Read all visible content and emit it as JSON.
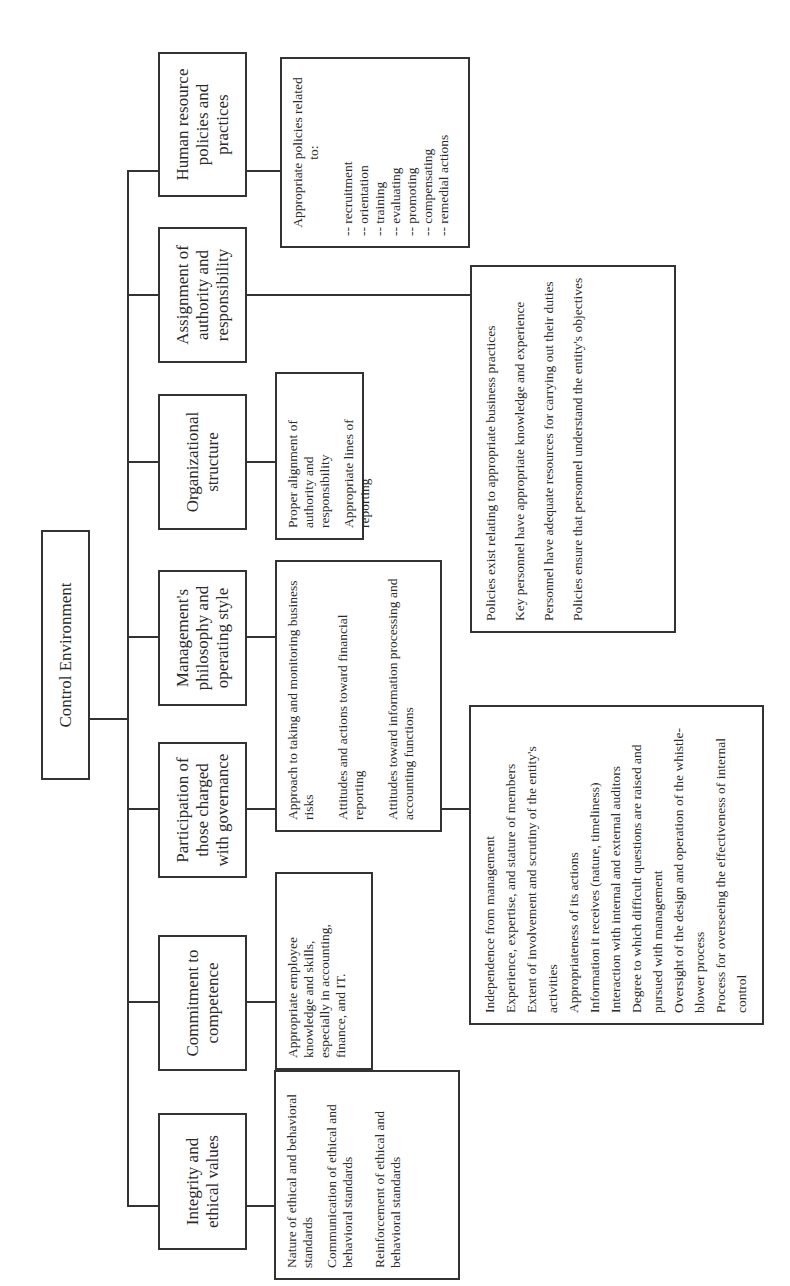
{
  "diagram": {
    "title_partial": "…OF THE CONTROL ENVIRONMENT (cropped)",
    "root": "Control Environment",
    "components": [
      {
        "label": "Integrity and ethical values",
        "details": [
          "Nature of ethical and behavioral standards",
          "Communication of ethical and behavioral standards",
          "Reinforcement of ethical and behavioral standards"
        ]
      },
      {
        "label": "Commitment to competence",
        "details": [
          "Appropriate employee knowledge and skills, especially in accounting, finance, and IT."
        ]
      },
      {
        "label": "Participation of those charged with governance",
        "details": [
          "Independence from management",
          "Experience, expertise, and stature of members",
          "Extent of involvement and scrutiny of the entity's activities",
          "Appropriateness of its actions",
          "Information it receives (nature, timeliness)",
          "Interaction with internal and external auditors",
          "Degree to which difficult questions are raised and pursued with management",
          "Oversight of the design and operation of the whistle-blower process",
          "Process for overseeing the effectiveness of internal control"
        ]
      },
      {
        "label": "Management's philosophy and operating style",
        "details": [
          "Approach to taking and monitoring business risks",
          "Attitudes and actions toward financial reporting",
          "Attitudes toward information processing and accounting functions"
        ]
      },
      {
        "label": "Organizational structure",
        "details": [
          "Proper alignment of authority and responsibility",
          "Appropriate lines of reporting"
        ]
      },
      {
        "label": "Assignment of authority and responsibility",
        "details": [
          "Policies exist relating to appropriate business practices",
          "Key personnel have appropriate knowledge and experience",
          "Personnel have adequate resources for carrying out their duties",
          "Policies ensure that personnel understand the entity's objectives"
        ]
      },
      {
        "label": "Human resource policies and practices",
        "details_heading": "Appropriate policies related to:",
        "details": [
          "-- recruitment",
          "-- orientation",
          "-- training",
          "-- evaluating",
          "-- promoting",
          "-- compensating",
          "-- remedial actions"
        ]
      }
    ]
  }
}
